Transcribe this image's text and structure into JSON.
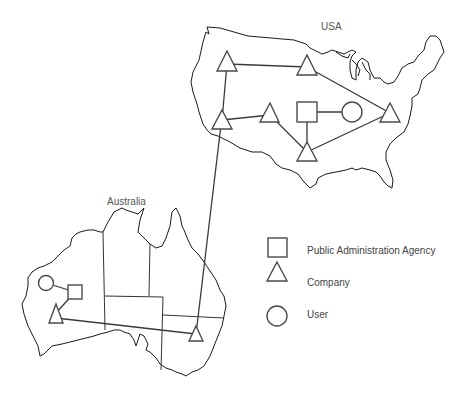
{
  "regions": {
    "usa": {
      "label": "USA"
    },
    "australia": {
      "label": "Australia"
    }
  },
  "legend": {
    "items": [
      {
        "shape": "square",
        "label": "Public Administration Agency"
      },
      {
        "shape": "triangle",
        "label": "Company"
      },
      {
        "shape": "circle",
        "label": "User"
      }
    ]
  },
  "nodes": [
    {
      "id": "us-nw-company",
      "type": "company",
      "region": "USA"
    },
    {
      "id": "us-n-company",
      "type": "company",
      "region": "USA"
    },
    {
      "id": "us-w-company",
      "type": "company",
      "region": "USA"
    },
    {
      "id": "us-mid-company",
      "type": "company",
      "region": "USA"
    },
    {
      "id": "us-agency",
      "type": "agency",
      "region": "USA"
    },
    {
      "id": "us-user",
      "type": "user",
      "region": "USA"
    },
    {
      "id": "us-e-company",
      "type": "company",
      "region": "USA"
    },
    {
      "id": "us-s-company",
      "type": "company",
      "region": "USA"
    },
    {
      "id": "au-user",
      "type": "user",
      "region": "Australia"
    },
    {
      "id": "au-agency",
      "type": "agency",
      "region": "Australia"
    },
    {
      "id": "au-sw-company",
      "type": "company",
      "region": "Australia"
    },
    {
      "id": "au-se-company",
      "type": "company",
      "region": "Australia"
    }
  ],
  "links": [
    [
      "us-nw-company",
      "us-n-company"
    ],
    [
      "us-nw-company",
      "us-w-company"
    ],
    [
      "us-n-company",
      "us-e-company"
    ],
    [
      "us-w-company",
      "us-mid-company"
    ],
    [
      "us-mid-company",
      "us-s-company"
    ],
    [
      "us-agency",
      "us-user"
    ],
    [
      "us-agency",
      "us-s-company"
    ],
    [
      "us-s-company",
      "us-e-company"
    ],
    [
      "us-w-company",
      "au-se-company"
    ],
    [
      "au-user",
      "au-agency"
    ],
    [
      "au-agency",
      "au-sw-company"
    ],
    [
      "au-sw-company",
      "au-se-company"
    ]
  ]
}
